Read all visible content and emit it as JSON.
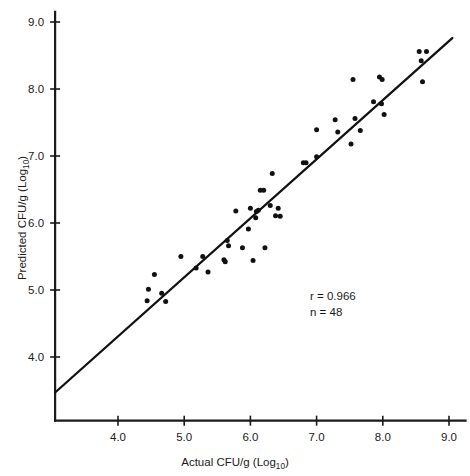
{
  "figure": {
    "width": 470,
    "height": 476,
    "background": "#ffffff",
    "ink_color": "#111111"
  },
  "annotations": {
    "correlation_label": "r = 0.966",
    "sample_size_label": "n = 48"
  },
  "chart_data": {
    "type": "scatter",
    "title": "",
    "subtitle": "",
    "xlabel_parts": {
      "main": "Actual CFU/g (Log",
      "subscript": "10",
      "tail": ")"
    },
    "ylabel_parts": {
      "main": "Predicted CFU/g (Log",
      "subscript": "10",
      "tail": ")"
    },
    "xlabel": "Actual CFU/g (Log10)",
    "ylabel": "Predicted CFU/g (Log10)",
    "xlim": [
      3.05,
      9.25
    ],
    "ylim": [
      3.05,
      9.15
    ],
    "xticks": [
      4.0,
      5.0,
      6.0,
      7.0,
      8.0,
      9.0
    ],
    "yticks": [
      4.0,
      5.0,
      6.0,
      7.0,
      8.0,
      9.0
    ],
    "xticklabels": [
      "4.0",
      "5.0",
      "6.0",
      "7.0",
      "8.0",
      "9.0"
    ],
    "yticklabels": [
      "4.0",
      "5.0",
      "6.0",
      "7.0",
      "8.0",
      "9.0"
    ],
    "grid": false,
    "legend": false,
    "legend_position": "none",
    "correlation_r": 0.966,
    "n": 48,
    "fit_line": {
      "type": "linear",
      "x_start": 3.05,
      "y_start": 3.47,
      "x_end": 9.05,
      "y_end": 8.76
    },
    "points": [
      [
        4.44,
        4.84
      ],
      [
        4.46,
        5.01
      ],
      [
        4.55,
        5.23
      ],
      [
        4.66,
        4.95
      ],
      [
        4.72,
        4.83
      ],
      [
        4.95,
        5.5
      ],
      [
        5.18,
        5.33
      ],
      [
        5.28,
        5.5
      ],
      [
        5.36,
        5.27
      ],
      [
        5.6,
        5.45
      ],
      [
        5.62,
        5.42
      ],
      [
        5.65,
        5.74
      ],
      [
        5.67,
        5.66
      ],
      [
        5.78,
        6.18
      ],
      [
        5.88,
        5.63
      ],
      [
        5.97,
        5.91
      ],
      [
        6.0,
        6.22
      ],
      [
        6.04,
        5.44
      ],
      [
        6.08,
        6.08
      ],
      [
        6.09,
        6.17
      ],
      [
        6.12,
        6.19
      ],
      [
        6.15,
        6.49
      ],
      [
        6.2,
        6.49
      ],
      [
        6.22,
        5.63
      ],
      [
        6.3,
        6.26
      ],
      [
        6.33,
        6.74
      ],
      [
        6.38,
        6.11
      ],
      [
        6.42,
        6.22
      ],
      [
        6.45,
        6.1
      ],
      [
        6.8,
        6.9
      ],
      [
        6.84,
        6.9
      ],
      [
        7.0,
        6.99
      ],
      [
        7.0,
        7.39
      ],
      [
        7.28,
        7.54
      ],
      [
        7.32,
        7.36
      ],
      [
        7.52,
        7.18
      ],
      [
        7.55,
        8.14
      ],
      [
        7.58,
        7.56
      ],
      [
        7.66,
        7.38
      ],
      [
        7.86,
        7.81
      ],
      [
        7.95,
        8.18
      ],
      [
        7.98,
        7.78
      ],
      [
        7.99,
        8.14
      ],
      [
        8.02,
        7.62
      ],
      [
        8.55,
        8.56
      ],
      [
        8.58,
        8.42
      ],
      [
        8.6,
        8.11
      ],
      [
        8.66,
        8.56
      ]
    ]
  }
}
